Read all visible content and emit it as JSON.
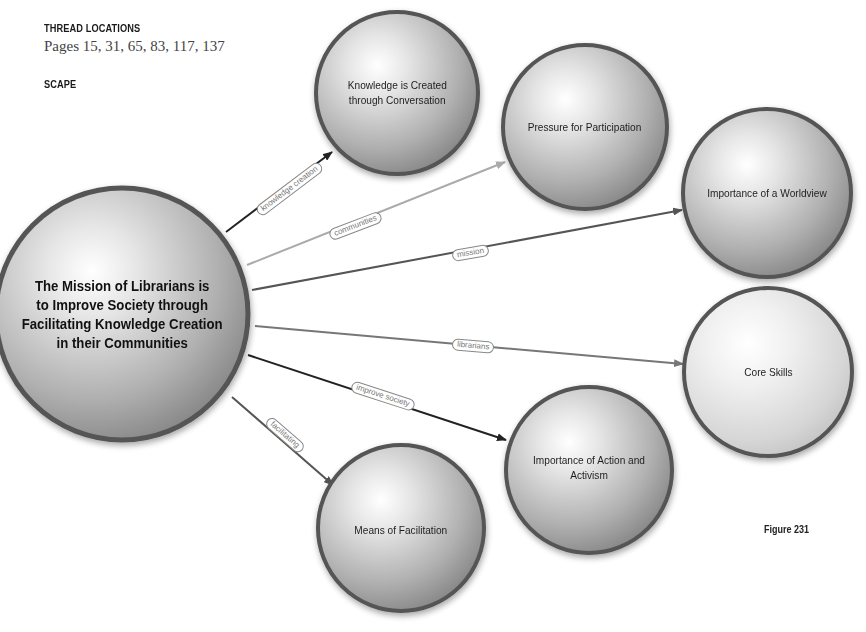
{
  "header": {
    "thread_locations_heading": "THREAD LOCATIONS",
    "pages_text": "Pages 15, 31, 65, 83, 117, 137",
    "scape_heading": "SCAPE"
  },
  "figure_label": "Figure 231",
  "colors": {
    "node_border": "#555555",
    "node_fill_light": "#f4f4f4",
    "node_fill_dark": "#8a8a8a",
    "edge_dark": "#222222",
    "edge_mid": "#555555",
    "edge_light": "#aaaaaa"
  },
  "central_node": {
    "id": "mission",
    "label": "The Mission of Librarians is to Improve Society through Facilitating Knowledge Creation in their Communities",
    "lines": [
      "The Mission of Librarians is",
      "to Improve Society through",
      "Facilitating Knowledge Creation",
      "in their Communities"
    ]
  },
  "nodes": [
    {
      "id": "knowledge",
      "label": "Knowledge is Created through Conversation",
      "lines": [
        "Knowledge is Created",
        "through Conversation"
      ]
    },
    {
      "id": "pressure",
      "label": "Pressure for Participation",
      "lines": [
        "Pressure for Participation"
      ]
    },
    {
      "id": "worldview",
      "label": "Importance of a Worldview",
      "lines": [
        "Importance of a Worldview"
      ]
    },
    {
      "id": "skills",
      "label": "Core Skills",
      "lines": [
        "Core Skills"
      ]
    },
    {
      "id": "action",
      "label": "Importance of Action and Activism",
      "lines": [
        "Importance of Action and Activism"
      ]
    },
    {
      "id": "means",
      "label": "Means of Facilitation",
      "lines": [
        "Means of Facilitation"
      ]
    }
  ],
  "edges": [
    {
      "from": "mission",
      "to": "knowledge",
      "label": "knowledge creation",
      "tone": "dark"
    },
    {
      "from": "mission",
      "to": "pressure",
      "label": "communities",
      "tone": "light"
    },
    {
      "from": "mission",
      "to": "worldview",
      "label": "mission",
      "tone": "mid"
    },
    {
      "from": "mission",
      "to": "skills",
      "label": "librarians",
      "tone": "mid-light"
    },
    {
      "from": "mission",
      "to": "action",
      "label": "improve society",
      "tone": "dark"
    },
    {
      "from": "mission",
      "to": "means",
      "label": "facilitating",
      "tone": "mid"
    }
  ]
}
